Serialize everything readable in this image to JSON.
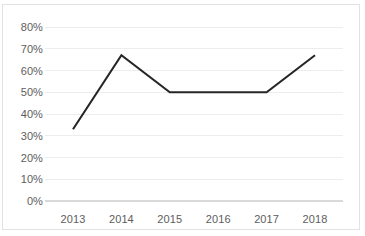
{
  "chart_data": {
    "type": "line",
    "title": "",
    "subtitle": "",
    "xlabel": "",
    "ylabel": "",
    "categories": [
      "2013",
      "2014",
      "2015",
      "2016",
      "2017",
      "2018"
    ],
    "values": [
      33,
      67,
      50,
      50,
      50,
      67
    ],
    "series": [
      {
        "name": "",
        "values": [
          33,
          67,
          50,
          50,
          50,
          67
        ]
      }
    ],
    "ylim": [
      0,
      80
    ],
    "ytick_labels": [
      "0%",
      "10%",
      "20%",
      "30%",
      "40%",
      "50%",
      "60%",
      "70%",
      "80%"
    ],
    "ytick_values": [
      0,
      10,
      20,
      30,
      40,
      50,
      60,
      70,
      80
    ],
    "xtick_labels": [
      "2013",
      "2014",
      "2015",
      "2016",
      "2017",
      "2018"
    ],
    "grid": "horizontal",
    "legend": "none",
    "annotations": [],
    "colors": {
      "line": "#262626",
      "gridline": "#ededed",
      "baseline": "#d9d9d9",
      "border": "#e2e2e2",
      "text": "#5d5d5d",
      "background": "#ffffff"
    }
  }
}
